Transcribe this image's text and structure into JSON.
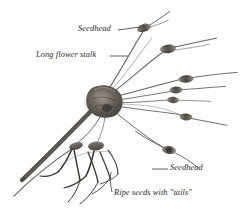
{
  "figure": {
    "kind": "botanical-photograph",
    "background_color": "#fefefe",
    "ink_color": "#3a3733",
    "hub_color": "#55504a",
    "label_color": "#2b2b2b"
  },
  "labels": {
    "seedhead_top": "Seedhead",
    "long_flower_stalk": "Long flower stalk",
    "seedhead_bottom": "Seedhead",
    "ripe_seeds": "Ripe seeds with \"tails\""
  },
  "leaders": {
    "seedhead_top": "line from text right edge to upper seedhead",
    "long_flower_stalk": "line from text right edge to flower stalk",
    "seedhead_bottom": "line from text left edge to lower-right seedhead",
    "ripe_seeds": "line rising from text to bent seed tails"
  }
}
